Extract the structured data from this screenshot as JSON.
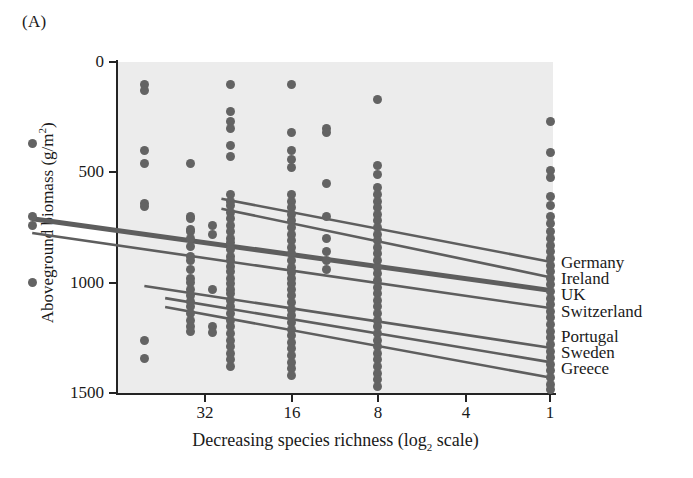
{
  "panel": {
    "label": "(A)"
  },
  "axes": {
    "y_title": "Aboveground biomass (g/",
    "y_title_unit": "m",
    "y_title_exp": "2",
    "y_title_close": ")",
    "y_ticks": [
      "1500",
      "1000",
      "500",
      "0"
    ],
    "x_title_a": "Decreasing species richness (log",
    "x_title_sub": "2",
    "x_title_b": " scale)",
    "x_ticks": [
      "32",
      "16",
      "8",
      "4",
      "1"
    ]
  },
  "legend": {
    "group_one": [
      "Germany",
      "Ireland",
      "UK",
      "Switzerland"
    ],
    "group_two": [
      "Portugal",
      "Sweden",
      "Greece"
    ]
  },
  "colors": {
    "plot_background": "#ececec",
    "point": "#636363",
    "line": "#5e5e5e",
    "axis": "#242424",
    "text": "#1a1a1a"
  },
  "chart_data": {
    "type": "scatter",
    "title": "",
    "xlabel": "Decreasing species richness (log2 scale)",
    "ylabel": "Aboveground biomass (g/m2)",
    "ylim": [
      0,
      1500
    ],
    "y_ticks": [
      0,
      500,
      1000,
      1500
    ],
    "x_axis_scale": "log2 decreasing",
    "x_ticks": [
      32,
      16,
      8,
      4,
      1
    ],
    "x_tick_pixels": [
      205,
      292,
      378,
      466,
      550
    ],
    "grid": false,
    "legend_position": "right-outside",
    "note": "Seven European field-site regression lines of aboveground biomass versus decreasing plant species richness; all slopes negative, converging toward monoculture (richness = 1).",
    "series": [
      {
        "name": "Germany",
        "line": {
          "x_start": 14,
          "y_start": 880,
          "x_end": 1,
          "y_end": 595
        }
      },
      {
        "name": "Ireland",
        "line": {
          "x_start": 14,
          "y_start": 835,
          "x_end": 1,
          "y_end": 525
        }
      },
      {
        "name": "UK",
        "line": {
          "x_start": 64,
          "y_start": 790,
          "x_end": 1,
          "y_end": 465
        },
        "emphasis": "thick"
      },
      {
        "name": "Switzerland",
        "line": {
          "x_start": 64,
          "y_start": 725,
          "x_end": 1,
          "y_end": 385
        }
      },
      {
        "name": "Portugal",
        "line": {
          "x_start": 26,
          "y_start": 485,
          "x_end": 1,
          "y_end": 205
        }
      },
      {
        "name": "Sweden",
        "line": {
          "x_start": 22,
          "y_start": 430,
          "x_end": 1,
          "y_end": 140
        }
      },
      {
        "name": "Greece",
        "line": {
          "x_start": 22,
          "y_start": 390,
          "x_end": 1,
          "y_end": 70
        }
      }
    ],
    "scatter_columns": [
      {
        "richness": 64,
        "values": [
          1130,
          800,
          760,
          500
        ]
      },
      {
        "richness": 26,
        "values": [
          1400,
          1370,
          1100,
          1040,
          860,
          845,
          240,
          155
        ]
      },
      {
        "richness": 18,
        "values": [
          1040,
          800,
          790,
          740,
          730,
          700,
          665,
          620,
          600,
          560,
          520,
          500,
          470,
          440,
          415,
          390,
          360,
          330,
          300,
          280
        ]
      },
      {
        "richness": 15,
        "values": [
          760,
          720,
          470,
          300,
          275
        ]
      },
      {
        "richness": 13,
        "values": [
          1400,
          1275,
          1230,
          1200,
          1120,
          1070,
          900,
          870,
          850,
          820,
          790,
          760,
          730,
          700,
          680,
          650,
          620,
          600,
          575,
          550,
          520,
          495,
          470,
          450,
          420,
          390,
          360,
          330,
          300,
          270,
          240,
          210,
          180,
          150,
          120
        ]
      },
      {
        "richness": 8,
        "values": [
          1400,
          1180,
          1100,
          1060,
          1020,
          900,
          870,
          840,
          810,
          780,
          750,
          720,
          690,
          660,
          630,
          600,
          570,
          545,
          520,
          495,
          470,
          440,
          410,
          380,
          350,
          320,
          290,
          260,
          230,
          200,
          170,
          140,
          110,
          80
        ]
      },
      {
        "richness": 6,
        "values": [
          1200,
          1180,
          950,
          800,
          700,
          640,
          600,
          560
        ]
      },
      {
        "richness": 4,
        "values": [
          1330,
          1030,
          990,
          930,
          900,
          870,
          840,
          810,
          780,
          750,
          720,
          690,
          660,
          630,
          600,
          570,
          540,
          510,
          480,
          450,
          420,
          390,
          360,
          330,
          300,
          270,
          240,
          210,
          180,
          150,
          120,
          90,
          60,
          30
        ]
      },
      {
        "richness": 1,
        "values": [
          1230,
          1090,
          1010,
          975,
          890,
          850,
          800,
          770,
          730,
          700,
          670,
          640,
          610,
          580,
          550,
          520,
          490,
          460,
          430,
          400,
          370,
          340,
          310,
          280,
          250,
          220,
          190,
          160,
          130,
          100,
          70,
          40,
          15
        ]
      }
    ]
  }
}
